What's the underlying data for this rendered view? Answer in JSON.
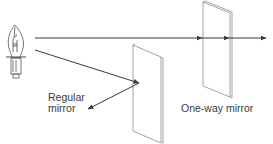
{
  "diagram": {
    "labels": {
      "regular_mirror_line1": "Regular",
      "regular_mirror_line2": "mirror",
      "one_way_mirror": "One-way mirror"
    },
    "components": [
      {
        "id": "light-bulb",
        "type": "light source"
      },
      {
        "id": "regular-mirror",
        "type": "mirror",
        "behavior": "reflects light"
      },
      {
        "id": "one-way-mirror",
        "type": "mirror",
        "behavior": "transmits light"
      }
    ],
    "rays": [
      {
        "id": "transmitted-ray",
        "path": "bulb → one-way mirror → passes through"
      },
      {
        "id": "reflected-ray",
        "path": "bulb → regular mirror → reflected back"
      }
    ],
    "colors": {
      "line": "#4a4a4a",
      "mirror_edge": "#8a8a8a",
      "background": "#ffffff"
    }
  }
}
